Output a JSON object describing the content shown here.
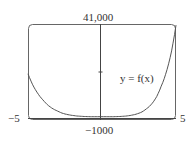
{
  "chart_data": {
    "type": "line",
    "title": "",
    "xlabel": "",
    "ylabel": "",
    "xlim": [
      -5,
      5
    ],
    "ylim": [
      -1000,
      41000
    ],
    "x_tick_labels": [
      "-5",
      "5"
    ],
    "y_tick_labels": [
      "41,000",
      "-1000"
    ],
    "series": [
      {
        "name": "y = f(x)",
        "x": [
          -5,
          -4,
          -3,
          -2,
          -1,
          0,
          1,
          2,
          3,
          4,
          5
        ],
        "values": [
          19000,
          7500,
          2500,
          600,
          80,
          0,
          80,
          700,
          3500,
          13500,
          40500
        ]
      }
    ],
    "annotations": [
      "y = f(x)"
    ],
    "grid": false,
    "legend": "none"
  },
  "labels": {
    "ymax": "41,000",
    "ymin": "−1000",
    "xmin": "−5",
    "xmax": "5",
    "curve": "y = f(x)"
  }
}
